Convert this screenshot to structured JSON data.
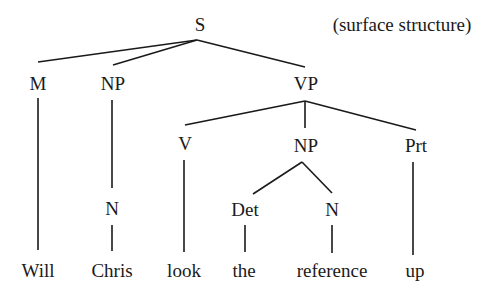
{
  "diagram": {
    "type": "syntax-tree",
    "annotation": "(surface structure)",
    "nodes": {
      "S": "S",
      "M": "M",
      "NP_subj": "NP",
      "VP": "VP",
      "N_subj": "N",
      "V": "V",
      "NP_obj": "NP",
      "Prt": "Prt",
      "Det": "Det",
      "N_obj": "N"
    },
    "words": {
      "will": "Will",
      "chris": "Chris",
      "look": "look",
      "the": "the",
      "reference": "reference",
      "up": "up"
    },
    "edges": [
      [
        "S",
        "M"
      ],
      [
        "S",
        "NP_subj"
      ],
      [
        "S",
        "VP"
      ],
      [
        "M",
        "Will"
      ],
      [
        "NP_subj",
        "N_subj"
      ],
      [
        "N_subj",
        "Chris"
      ],
      [
        "VP",
        "V"
      ],
      [
        "VP",
        "NP_obj"
      ],
      [
        "VP",
        "Prt"
      ],
      [
        "V",
        "look"
      ],
      [
        "NP_obj",
        "Det"
      ],
      [
        "NP_obj",
        "N_obj"
      ],
      [
        "Det",
        "the"
      ],
      [
        "N_obj",
        "reference"
      ],
      [
        "Prt",
        "up"
      ]
    ]
  }
}
